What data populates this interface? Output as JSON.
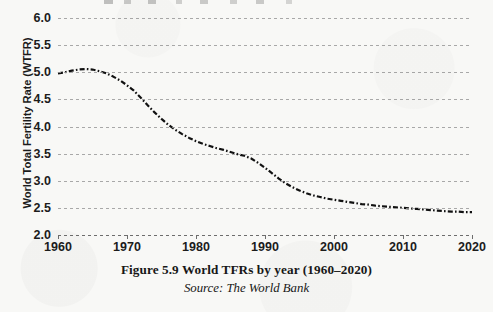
{
  "figure": {
    "caption": "Figure 5.9 World TFRs by year (1960–2020)",
    "source": "Source: The World Bank",
    "line_color": "#111111",
    "grid_color": "#9a9a9a",
    "background_color": "#f8f8f6"
  },
  "chart_data": {
    "type": "line",
    "title": "Figure 5.9 World TFRs by year (1960–2020)",
    "subtitle": "Source: The World Bank",
    "xlabel": "",
    "ylabel": "World Total Fertility Rate (WTFR)",
    "xlim": [
      1960,
      2020
    ],
    "ylim": [
      2.0,
      6.0
    ],
    "grid": true,
    "grid_axis": "y",
    "legend": false,
    "line_style": "dash-dot",
    "x_ticks": [
      1960,
      1970,
      1980,
      1990,
      2000,
      2010,
      2020
    ],
    "x_tick_labels": [
      "1960",
      "1970",
      "1980",
      "1990",
      "2000",
      "2010",
      "2020"
    ],
    "y_ticks": [
      2.0,
      2.5,
      3.0,
      3.5,
      4.0,
      4.5,
      5.0,
      5.5,
      6.0
    ],
    "y_tick_labels": [
      "2.0",
      "2.5",
      "3.0",
      "3.5",
      "4.0",
      "4.5",
      "5.0",
      "5.5",
      "6.0"
    ],
    "series": [
      {
        "name": "World Total Fertility Rate (WTFR)",
        "x": [
          1960,
          1961,
          1962,
          1963,
          1964,
          1965,
          1966,
          1967,
          1968,
          1969,
          1970,
          1971,
          1972,
          1973,
          1974,
          1975,
          1976,
          1977,
          1978,
          1979,
          1980,
          1981,
          1982,
          1983,
          1984,
          1985,
          1986,
          1987,
          1988,
          1989,
          1990,
          1991,
          1992,
          1993,
          1994,
          1995,
          1996,
          1997,
          1998,
          1999,
          2000,
          2001,
          2002,
          2003,
          2004,
          2005,
          2006,
          2007,
          2008,
          2009,
          2010,
          2011,
          2012,
          2013,
          2014,
          2015,
          2016,
          2017,
          2018,
          2019,
          2020
        ],
        "values": [
          4.98,
          5.0,
          5.03,
          5.05,
          5.06,
          5.05,
          5.02,
          4.98,
          4.92,
          4.85,
          4.76,
          4.66,
          4.53,
          4.39,
          4.26,
          4.14,
          4.03,
          3.94,
          3.86,
          3.79,
          3.73,
          3.68,
          3.64,
          3.6,
          3.57,
          3.53,
          3.49,
          3.46,
          3.41,
          3.33,
          3.24,
          3.14,
          3.04,
          2.95,
          2.88,
          2.82,
          2.77,
          2.73,
          2.7,
          2.67,
          2.65,
          2.63,
          2.61,
          2.59,
          2.57,
          2.56,
          2.54,
          2.53,
          2.52,
          2.51,
          2.5,
          2.49,
          2.48,
          2.47,
          2.46,
          2.45,
          2.44,
          2.43,
          2.43,
          2.42,
          2.42
        ]
      }
    ],
    "annotations": []
  }
}
